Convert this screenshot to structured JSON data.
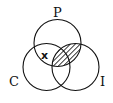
{
  "diagram": {
    "type": "venn",
    "sets": [
      {
        "label": "P",
        "cx": 57.5,
        "cy": 43,
        "r": 23.5
      },
      {
        "label": "C",
        "cx": 46.5,
        "cy": 67,
        "r": 23.5
      },
      {
        "label": "I",
        "cx": 75.5,
        "cy": 67,
        "r": 23.5
      }
    ],
    "labels": {
      "p": "P",
      "c": "C",
      "i": "I"
    },
    "marker": "x",
    "marker_region": "P ∩ C only",
    "shaded_region": "P ∩ I",
    "line_color": "#111111",
    "background": "#ffffff"
  }
}
